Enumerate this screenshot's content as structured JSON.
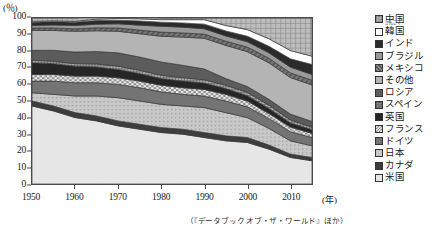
{
  "axes": {
    "y_unit": "(％)",
    "x_unit": "(年)",
    "y_ticks": [
      "0",
      "10",
      "20",
      "30",
      "40",
      "50",
      "60",
      "70",
      "80",
      "90",
      "100"
    ],
    "x_ticks": [
      "1950",
      "1960",
      "1970",
      "1980",
      "1990",
      "2000",
      "2010"
    ]
  },
  "legend": {
    "items": [
      {
        "label": "中国",
        "ruby": "",
        "color": "#a8a8a8",
        "pattern": "light-grid"
      },
      {
        "label": "韓国",
        "ruby": "かんこく",
        "color": "#ffffff",
        "pattern": "solid"
      },
      {
        "label": "インド",
        "ruby": "",
        "color": "#2b2b2b",
        "pattern": "solid"
      },
      {
        "label": "ブラジル",
        "ruby": "",
        "color": "#9a9a9a",
        "pattern": "solid"
      },
      {
        "label": "メキシコ",
        "ruby": "",
        "color": "#6e6e6e",
        "pattern": "diag"
      },
      {
        "label": "その他",
        "ruby": "",
        "color": "#b4b4b4",
        "pattern": "solid"
      },
      {
        "label": "ロシア",
        "ruby": "",
        "color": "#5c5c5c",
        "pattern": "solid"
      },
      {
        "label": "スペイン",
        "ruby": "",
        "color": "#8e8e8e",
        "pattern": "fine-grid"
      },
      {
        "label": "英国",
        "ruby": "",
        "color": "#262626",
        "pattern": "solid"
      },
      {
        "label": "フランス",
        "ruby": "",
        "color": "#d8d8d8",
        "pattern": "checker"
      },
      {
        "label": "ドイツ",
        "ruby": "",
        "color": "#747474",
        "pattern": "solid"
      },
      {
        "label": "日本",
        "ruby": "",
        "color": "#c2c2c2",
        "pattern": "dots"
      },
      {
        "label": "カナダ",
        "ruby": "",
        "color": "#3d3d3d",
        "pattern": "solid"
      },
      {
        "label": "米国",
        "ruby": "",
        "color": "#e6e6e6",
        "pattern": "solid"
      }
    ]
  },
  "source_note": "（『データブック オブ・ザ・ワールド』ほか）",
  "chart_data": {
    "type": "area",
    "title": "",
    "xlabel": "(年)",
    "ylabel": "(％)",
    "xlim": [
      1950,
      2015
    ],
    "ylim": [
      0,
      100
    ],
    "grid": false,
    "legend_position": "right",
    "stacking": "normalized-100",
    "stack_order_bottom_to_top": [
      "米国",
      "カナダ",
      "日本",
      "ドイツ",
      "フランス",
      "英国",
      "スペイン",
      "ロシア",
      "その他",
      "メキシコ",
      "ブラジル",
      "インド",
      "韓国",
      "中国"
    ],
    "x": [
      1950,
      1955,
      1960,
      1965,
      1970,
      1975,
      1980,
      1985,
      1990,
      1995,
      2000,
      2005,
      2010,
      2015
    ],
    "series": [
      {
        "name": "米国",
        "values": [
          47.0,
          44.0,
          40.0,
          38.0,
          35.0,
          33.0,
          31.0,
          30.0,
          28.0,
          26.0,
          25.0,
          21.0,
          16.0,
          14.0
        ]
      },
      {
        "name": "カナダ",
        "values": [
          3.0,
          3.0,
          3.0,
          3.0,
          3.0,
          3.0,
          3.0,
          3.0,
          3.0,
          3.0,
          3.0,
          2.5,
          2.0,
          2.0
        ]
      },
      {
        "name": "日本",
        "values": [
          5.0,
          7.0,
          10.0,
          12.0,
          14.0,
          14.0,
          14.0,
          14.0,
          15.0,
          14.0,
          12.0,
          10.0,
          8.0,
          7.0
        ]
      },
      {
        "name": "ドイツ",
        "values": [
          7.0,
          8.0,
          8.0,
          8.0,
          8.0,
          8.0,
          7.5,
          7.0,
          7.0,
          7.0,
          6.5,
          6.0,
          5.5,
          5.0
        ]
      },
      {
        "name": "フランス",
        "values": [
          4.0,
          4.0,
          4.0,
          4.0,
          4.0,
          4.0,
          4.0,
          4.0,
          4.0,
          4.0,
          3.5,
          3.0,
          2.8,
          2.5
        ]
      },
      {
        "name": "英国",
        "values": [
          7.0,
          6.5,
          6.0,
          5.5,
          5.0,
          4.5,
          4.0,
          4.0,
          3.8,
          3.5,
          3.2,
          3.0,
          2.5,
          2.2
        ]
      },
      {
        "name": "スペイン",
        "values": [
          1.5,
          1.5,
          1.5,
          1.8,
          2.0,
          2.0,
          2.0,
          2.0,
          2.0,
          2.0,
          2.0,
          2.0,
          1.8,
          1.5
        ]
      },
      {
        "name": "ロシア",
        "values": [
          6.0,
          6.5,
          7.0,
          7.5,
          8.0,
          8.0,
          8.0,
          7.5,
          6.5,
          4.0,
          3.5,
          3.5,
          3.5,
          3.5
        ]
      },
      {
        "name": "その他",
        "values": [
          12.0,
          12.0,
          12.5,
          12.5,
          13.0,
          14.0,
          15.5,
          17.0,
          18.5,
          20.0,
          21.0,
          22.0,
          22.0,
          22.0
        ]
      },
      {
        "name": "メキシコ",
        "values": [
          1.5,
          1.5,
          1.5,
          1.8,
          2.0,
          2.2,
          2.5,
          2.5,
          2.5,
          2.5,
          2.8,
          2.8,
          2.8,
          2.8
        ]
      },
      {
        "name": "ブラジル",
        "values": [
          1.5,
          1.8,
          2.0,
          2.2,
          2.5,
          3.0,
          3.5,
          3.5,
          3.2,
          3.2,
          3.2,
          3.2,
          3.5,
          3.5
        ]
      },
      {
        "name": "インド",
        "values": [
          2.0,
          2.0,
          2.0,
          2.2,
          2.2,
          2.5,
          2.5,
          2.5,
          2.8,
          3.0,
          3.3,
          4.0,
          5.0,
          6.0
        ]
      },
      {
        "name": "韓国",
        "values": [
          0.5,
          0.5,
          0.5,
          0.8,
          1.0,
          1.3,
          1.5,
          2.0,
          2.7,
          3.3,
          4.0,
          4.5,
          5.0,
          5.0
        ]
      },
      {
        "name": "中国",
        "values": [
          2.0,
          1.7,
          2.0,
          1.7,
          1.3,
          1.5,
          1.0,
          1.0,
          1.0,
          4.5,
          7.0,
          12.5,
          19.6,
          23.0
        ]
      }
    ]
  }
}
